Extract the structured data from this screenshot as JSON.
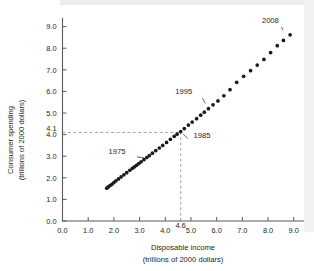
{
  "chart_data": {
    "type": "scatter",
    "title": "",
    "xlabel": "Disposable income (trillions of 2000 dollars)",
    "ylabel": "Consumer spending (trillions of 2000 dollars)",
    "xlabel_line1": "Disposable income",
    "xlabel_line2": "(trillions of 2000 dollars)",
    "ylabel_line1": "Consumer spending",
    "ylabel_line2": "(trillions of 2000 dollars)",
    "xlim": [
      0.0,
      9.4
    ],
    "ylim": [
      0.0,
      9.4
    ],
    "xticks": [
      "0.0",
      "1.0",
      "2.0",
      "3.0",
      "4.0",
      "5.0",
      "6.0",
      "7.0",
      "8.0",
      "9.0"
    ],
    "xtick_values": [
      0.0,
      1.0,
      2.0,
      3.0,
      4.0,
      5.0,
      6.0,
      7.0,
      8.0,
      9.0
    ],
    "yticks": [
      "0.0",
      "1.0",
      "2.0",
      "3.0",
      "4.0",
      "5.0",
      "6.0",
      "7.0",
      "8.0",
      "9.0"
    ],
    "ytick_values": [
      0.0,
      1.0,
      2.0,
      3.0,
      4.0,
      5.0,
      6.0,
      7.0,
      8.0,
      9.0
    ],
    "extra_xtick_label": "4.6",
    "extra_xtick_value": 4.6,
    "extra_ytick_label": "4.1",
    "extra_ytick_value": 4.1,
    "grid": false,
    "legend": "none",
    "reference_lines": [
      {
        "name": "vertical-4.6",
        "orientation": "vertical",
        "value": 4.6,
        "style": "dashed",
        "from": 0.0,
        "to": 4.1
      },
      {
        "name": "horizontal-4.1",
        "orientation": "horizontal",
        "value": 4.1,
        "style": "dashed",
        "from": 0.0,
        "to": 4.6
      }
    ],
    "x": [
      1.72,
      1.78,
      1.85,
      1.92,
      2.0,
      2.08,
      2.18,
      2.28,
      2.39,
      2.5,
      2.62,
      2.72,
      2.8,
      2.88,
      2.97,
      3.06,
      3.17,
      3.28,
      3.38,
      3.5,
      3.63,
      3.77,
      3.9,
      4.05,
      4.2,
      4.35,
      4.46,
      4.6,
      4.74,
      4.9,
      5.05,
      5.22,
      5.38,
      5.52,
      5.68,
      5.86,
      6.05,
      6.28,
      6.52,
      6.78,
      7.05,
      7.32,
      7.58,
      7.84,
      8.1,
      8.36,
      8.6,
      8.86
    ],
    "y": [
      1.52,
      1.58,
      1.64,
      1.7,
      1.78,
      1.86,
      1.95,
      2.04,
      2.14,
      2.24,
      2.35,
      2.44,
      2.51,
      2.58,
      2.66,
      2.74,
      2.84,
      2.94,
      3.03,
      3.14,
      3.26,
      3.38,
      3.5,
      3.64,
      3.78,
      3.92,
      4.02,
      4.14,
      4.28,
      4.44,
      4.58,
      4.74,
      4.9,
      5.04,
      5.2,
      5.38,
      5.56,
      5.8,
      6.08,
      6.42,
      6.7,
      6.96,
      7.22,
      7.48,
      7.8,
      8.12,
      8.36,
      8.62
    ],
    "annotations": [
      {
        "name": "1975",
        "label": "1975",
        "label_x": 2.45,
        "label_y": 3.08,
        "point_x": 3.3,
        "point_y": 2.9
      },
      {
        "name": "1985",
        "label": "1985",
        "label_x": 5.1,
        "label_y": 3.84,
        "point_x": 4.6,
        "point_y": 4.14
      },
      {
        "name": "1995",
        "label": "1995",
        "label_x": 5.05,
        "label_y": 5.88,
        "point_x": 5.62,
        "point_y": 5.32
      },
      {
        "name": "2008",
        "label": "2008",
        "label_x": 8.42,
        "label_y": 9.18,
        "point_x": 8.62,
        "point_y": 8.7
      }
    ]
  }
}
